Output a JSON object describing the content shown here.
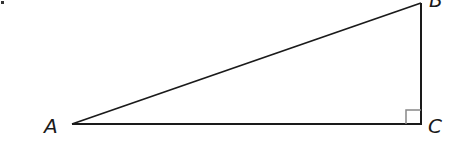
{
  "diagram": {
    "type": "right-triangle",
    "vertices": {
      "A": {
        "label": "A"
      },
      "B": {
        "label": "B"
      },
      "C": {
        "label": "C"
      }
    },
    "right_angle_at": "C",
    "stroke_color": "#1a1a1a",
    "marker_color": "#888888"
  }
}
